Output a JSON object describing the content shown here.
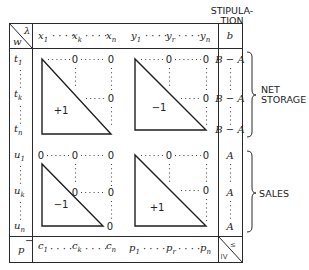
{
  "header": {
    "corner_top": "λ",
    "corner_bottom": "w",
    "stipulation_line1": "STIPULA-",
    "stipulation_line2": "TION",
    "columns_x": [
      {
        "base": "x",
        "sub": "1"
      },
      {
        "base": "x",
        "sub": "k"
      },
      {
        "base": "x",
        "sub": "n"
      }
    ],
    "columns_y": [
      {
        "base": "y",
        "sub": "1"
      },
      {
        "base": "y",
        "sub": "r"
      },
      {
        "base": "y",
        "sub": "n"
      }
    ],
    "b_column": "b",
    "ellipsis": "· · · ·"
  },
  "rows": {
    "net_storage": [
      {
        "base": "t",
        "sub": "1"
      },
      {
        "base": "t",
        "sub": "k"
      },
      {
        "base": "t",
        "sub": "n"
      }
    ],
    "sales": [
      {
        "base": "u",
        "sub": "1"
      },
      {
        "base": "u",
        "sub": "k"
      },
      {
        "base": "u",
        "sub": "n"
      }
    ]
  },
  "blocks": {
    "top_left_value": "+1",
    "top_right_value": "−1",
    "bottom_left_value": "−1",
    "bottom_right_value": "+1",
    "zero": "0"
  },
  "stipulation_values": {
    "net_storage": "B − A",
    "sales": "A"
  },
  "groups": {
    "net_storage_line1": "NET",
    "net_storage_line2": "STORAGE",
    "sales": "SALES"
  },
  "footer": {
    "row_label": "p",
    "row_label_mark": "−",
    "costs": [
      {
        "base": "c",
        "sub": "1"
      },
      {
        "base": "c",
        "sub": "k"
      },
      {
        "base": "c",
        "sub": "n"
      }
    ],
    "prices": [
      {
        "base": "p",
        "sub": "1"
      },
      {
        "base": "p",
        "sub": "r"
      },
      {
        "base": "p",
        "sub": "n"
      }
    ],
    "relation_top": "≤",
    "relation_bottom": "IV"
  }
}
